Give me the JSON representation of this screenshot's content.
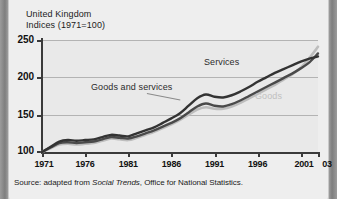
{
  "figure": {
    "title_line1": "United Kingdom",
    "title_line2": "Indices (1971=100)",
    "source_prefix": "Source: adapted from ",
    "source_italic": "Social Trends",
    "source_suffix": ", Office for National Statistics.",
    "colors": {
      "goods": "#bdbdbd",
      "goods_and_services": "#4a4a4a",
      "services": "#333333",
      "grid": "#b3b3b3",
      "axis": "#3a3a3a",
      "plot_background": "#e9e9e9",
      "card_background": "#eeeeee"
    }
  },
  "chart_data": {
    "type": "line",
    "title": "United Kingdom Indices (1971=100)",
    "subtitle": "Indices (1971=100)",
    "xlabel": "",
    "ylabel": "Indices (1971=100)",
    "xlim": [
      1971,
      2003
    ],
    "ylim": [
      100,
      250
    ],
    "ytick_labels": [
      "100",
      "150",
      "200",
      "250"
    ],
    "ytick_values": [
      100,
      150,
      200,
      250
    ],
    "xtick_labels": [
      "1971",
      "1976",
      "1981",
      "1986",
      "1991",
      "1996",
      "2001",
      "03"
    ],
    "xtick_values": [
      1971,
      1976,
      1981,
      1986,
      1991,
      1996,
      2001,
      2003
    ],
    "grid": "horizontal",
    "legend": "inline-annotations",
    "annotations": [
      {
        "text": "Services",
        "series": "Services",
        "x": 1994,
        "y": 212
      },
      {
        "text": "Goods and services",
        "series": "Goods and services",
        "x": 1982,
        "y": 182
      },
      {
        "text": "Goods",
        "series": "Goods",
        "x": 1997,
        "y": 176
      }
    ],
    "x": [
      1971,
      1972,
      1973,
      1974,
      1975,
      1976,
      1977,
      1978,
      1979,
      1980,
      1981,
      1982,
      1983,
      1984,
      1985,
      1986,
      1987,
      1988,
      1989,
      1990,
      1991,
      1992,
      1993,
      1994,
      1995,
      1996,
      1997,
      1998,
      1999,
      2000,
      2001,
      2002,
      2003
    ],
    "series": [
      {
        "name": "Services",
        "color": "#333333",
        "values": [
          100,
          107,
          114,
          116,
          115,
          116,
          117,
          120,
          123,
          122,
          121,
          125,
          129,
          133,
          139,
          145,
          152,
          162,
          172,
          177,
          174,
          173,
          176,
          181,
          187,
          194,
          200,
          206,
          211,
          216,
          221,
          225,
          228
        ]
      },
      {
        "name": "Goods and services",
        "color": "#4a4a4a",
        "values": [
          100,
          106,
          112,
          113,
          112,
          113,
          114,
          117,
          120,
          119,
          118,
          121,
          125,
          129,
          134,
          139,
          145,
          153,
          161,
          165,
          162,
          161,
          164,
          169,
          175,
          181,
          187,
          193,
          199,
          205,
          212,
          220,
          232
        ]
      },
      {
        "name": "Goods",
        "color": "#bdbdbd",
        "values": [
          100,
          105,
          110,
          111,
          110,
          111,
          112,
          115,
          118,
          117,
          116,
          119,
          123,
          127,
          132,
          137,
          143,
          150,
          157,
          160,
          158,
          158,
          161,
          166,
          172,
          178,
          184,
          190,
          197,
          204,
          213,
          226,
          241
        ]
      }
    ]
  }
}
